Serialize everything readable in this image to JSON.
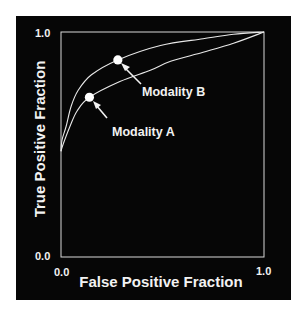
{
  "chart_data": {
    "type": "line",
    "title": "",
    "xlabel": "False Positive Fraction",
    "ylabel": "True Positive Fraction",
    "xlim": [
      0.0,
      1.0
    ],
    "ylim": [
      0.0,
      1.0
    ],
    "x_ticks": [
      "0.0",
      "1.0"
    ],
    "y_ticks": [
      "0.0",
      "1.0"
    ],
    "grid": false,
    "legend": null,
    "background_color": "#060606",
    "foreground_color": "#f2f2f2",
    "series": [
      {
        "name": "Upper ROC curve (Modality B)",
        "x": [
          0.0,
          0.005,
          0.025,
          0.05,
          0.084,
          0.15,
          0.28,
          0.49,
          0.7,
          0.85,
          1.0
        ],
        "y": [
          0.47,
          0.52,
          0.58,
          0.67,
          0.74,
          0.81,
          0.876,
          0.94,
          0.97,
          0.99,
          1.0
        ]
      },
      {
        "name": "Lower ROC curve (Modality A)",
        "x": [
          0.0,
          0.01,
          0.044,
          0.08,
          0.14,
          0.29,
          0.44,
          0.54,
          0.7,
          0.85,
          1.0
        ],
        "y": [
          0.47,
          0.5,
          0.58,
          0.65,
          0.71,
          0.78,
          0.83,
          0.87,
          0.91,
          0.95,
          1.0
        ]
      }
    ],
    "points": [
      {
        "label": "Modality B",
        "x": 0.28,
        "y": 0.876,
        "series": "Upper ROC curve (Modality B)"
      },
      {
        "label": "Modality A",
        "x": 0.14,
        "y": 0.71,
        "series": "Lower ROC curve (Modality A)"
      }
    ],
    "annotations": [
      {
        "text": "Modality B",
        "arrow_to": [
          0.28,
          0.876
        ]
      },
      {
        "text": "Modality A",
        "arrow_to": [
          0.14,
          0.71
        ]
      }
    ]
  },
  "labels": {
    "x_axis": "False Positive Fraction",
    "y_axis": "True Positive Fraction",
    "x_tick_min": "0.0",
    "x_tick_max": "1.0",
    "y_tick_min": "0.0",
    "y_tick_max": "1.0",
    "annotation_b": "Modality B",
    "annotation_a": "Modality A"
  }
}
